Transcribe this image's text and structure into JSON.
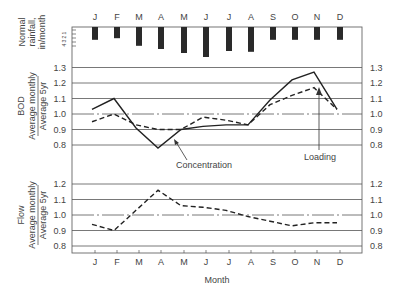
{
  "chart_data": [
    {
      "type": "bar",
      "title": "Normal rainfall",
      "ylabel": "Normal rainfall, in/month",
      "categories": [
        "J",
        "F",
        "M",
        "A",
        "M",
        "J",
        "J",
        "A",
        "S",
        "O",
        "N",
        "D"
      ],
      "values": [
        3.2,
        2.8,
        4.7,
        5.5,
        6.5,
        7.5,
        6.0,
        6.2,
        3.2,
        3.2,
        3.2,
        3.2
      ],
      "yticks": [
        "1",
        "2",
        "3",
        "4"
      ],
      "orientation": "bars hang downward from top axis"
    },
    {
      "type": "line",
      "ylabel_top": "BOD",
      "ylabel_num": "Average monthly",
      "ylabel_den": "Average 5yr",
      "categories": [
        "J",
        "F",
        "M",
        "A",
        "M",
        "J",
        "J",
        "A",
        "S",
        "O",
        "N",
        "D"
      ],
      "ylim": [
        0.8,
        1.3
      ],
      "yticks": [
        0.8,
        0.9,
        1.0,
        1.1,
        1.2,
        1.3
      ],
      "grid": true,
      "reference_line": 1.0,
      "series": [
        {
          "name": "Concentration",
          "style": "solid",
          "values": [
            1.03,
            1.1,
            0.91,
            0.78,
            0.9,
            0.92,
            0.93,
            0.93,
            1.09,
            1.22,
            1.27,
            1.03
          ]
        },
        {
          "name": "Loading",
          "style": "dashed",
          "values": [
            0.95,
            1.0,
            0.93,
            0.9,
            0.9,
            0.98,
            0.96,
            0.93,
            1.06,
            1.12,
            1.17,
            1.03
          ]
        }
      ],
      "annotations": [
        "Concentration",
        "Loading"
      ]
    },
    {
      "type": "line",
      "ylabel_top": "Flow",
      "ylabel_num": "Average monthly",
      "ylabel_den": "Average 5yr",
      "categories": [
        "J",
        "F",
        "M",
        "A",
        "M",
        "J",
        "J",
        "A",
        "S",
        "O",
        "N",
        "D"
      ],
      "ylim": [
        0.8,
        1.2
      ],
      "yticks": [
        0.8,
        0.9,
        1.0,
        1.1,
        1.2
      ],
      "grid": true,
      "reference_line": 1.0,
      "xlabel": "Month",
      "series": [
        {
          "name": "Flow",
          "style": "dashed",
          "values": [
            0.94,
            0.9,
            1.03,
            1.16,
            1.06,
            1.05,
            1.03,
            0.99,
            0.96,
            0.93,
            0.95,
            0.95
          ]
        }
      ]
    }
  ],
  "labels": {
    "rain_line1": "Normal",
    "rain_line2": "rainfall,",
    "rain_line3": "in/month",
    "bod_top": "BOD",
    "avg_monthly": "Average monthly",
    "avg_5yr": "Average 5yr",
    "flow_top": "Flow",
    "concentration": "Concentration",
    "loading": "Loading",
    "xlabel": "Month"
  }
}
